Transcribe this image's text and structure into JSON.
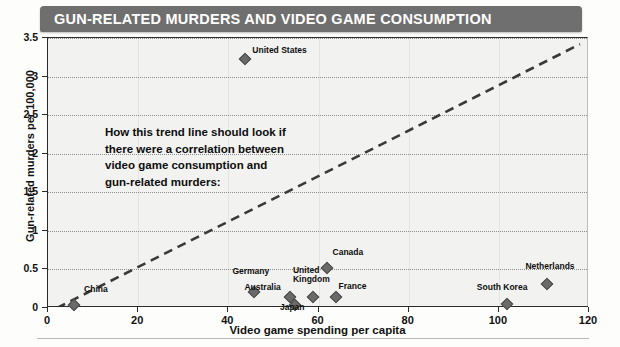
{
  "header": {
    "title": "GUN-RELATED MURDERS AND VIDEO GAME CONSUMPTION",
    "band_color": "#6f6f6f",
    "title_color": "#ffffff"
  },
  "annotation": {
    "line1": "How this trend line should look if",
    "line2": "there were a correlation between",
    "line3": "video game consumption and",
    "line4": "gun-related murders:"
  },
  "chart_data": {
    "type": "scatter",
    "title": "GUN-RELATED MURDERS AND VIDEO GAME CONSUMPTION",
    "xlabel": "Video game spending per capita",
    "ylabel": "Gun-related murders per 100,000",
    "xlim": [
      0,
      120
    ],
    "ylim": [
      0,
      3.5
    ],
    "xticks": [
      0,
      20,
      40,
      60,
      80,
      100,
      120
    ],
    "xtick_labels": [
      "0",
      "20",
      "40",
      "60",
      "80",
      "100",
      "120"
    ],
    "yticks": [
      0,
      0.5,
      1,
      1.5,
      2,
      2.5,
      3,
      3.5
    ],
    "ytick_labels": [
      "0",
      "0.5",
      "1",
      "1.5",
      "2",
      "2.5",
      "3",
      "3.5"
    ],
    "grid": "horizontal-dotted-and-faint-vertical",
    "legend": "none",
    "marker": "diamond",
    "marker_color": "#6a6a6a",
    "points": [
      {
        "label": "China",
        "x": 6,
        "y": 0.03,
        "label_dx": 10,
        "label_dy": -11
      },
      {
        "label": "Germany",
        "x": 46,
        "y": 0.2,
        "label_dx": -22,
        "label_dy": -16
      },
      {
        "label": "Australia",
        "x": 54,
        "y": 0.13,
        "label_dx": -46,
        "label_dy": -5
      },
      {
        "label": "Japan",
        "x": 55,
        "y": 0.02,
        "label_dx": -15,
        "label_dy": 7
      },
      {
        "label": "United Kingdom",
        "x": 59,
        "y": 0.13,
        "label_dx": -20,
        "label_dy": -22
      },
      {
        "label": "France",
        "x": 64,
        "y": 0.13,
        "label_dx": 3,
        "label_dy": -6
      },
      {
        "label": "Canada",
        "x": 62,
        "y": 0.51,
        "label_dx": 6,
        "label_dy": -11
      },
      {
        "label": "United States",
        "x": 44,
        "y": 3.21,
        "label_dx": 7,
        "label_dy": -4
      },
      {
        "label": "South Korea",
        "x": 102,
        "y": 0.04,
        "label_dx": -30,
        "label_dy": -12
      },
      {
        "label": "Netherlands",
        "x": 111,
        "y": 0.3,
        "label_dx": -22,
        "label_dy": -13
      }
    ],
    "trendline": {
      "style": "dashed",
      "color": "#3a3a3a",
      "x_start": 2,
      "y_start": 0.0,
      "x_end": 118,
      "y_end": 3.42,
      "note": "Hypothetical correlation line; does not fit the plotted data"
    }
  }
}
